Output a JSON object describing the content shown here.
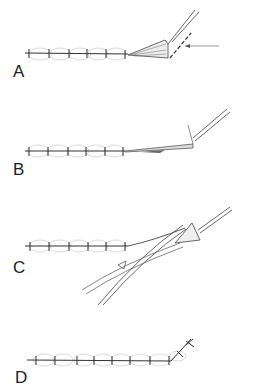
{
  "figure": {
    "type": "surgical-illustration",
    "panels": [
      {
        "id": "A",
        "label": "A"
      },
      {
        "id": "B",
        "label": "B"
      },
      {
        "id": "C",
        "label": "C"
      },
      {
        "id": "D",
        "label": "D"
      }
    ],
    "colors": {
      "line": "#333333",
      "tissue": "#bbbbbb",
      "background": "#ffffff"
    }
  }
}
